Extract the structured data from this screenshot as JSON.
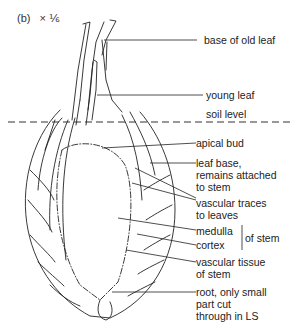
{
  "figure": {
    "panel_label": "(b)",
    "magnification": "× ⅙",
    "labels": {
      "base_of_old_leaf": "base of old leaf",
      "young_leaf": "young leaf",
      "soil_level": "soil level",
      "apical_bud": "apical bud",
      "leaf_base_1": "leaf base,",
      "leaf_base_2": "remains attached",
      "leaf_base_3": "to stem",
      "vascular_traces_1": "vascular traces",
      "vascular_traces_2": "to leaves",
      "medulla": "medulla",
      "cortex": "cortex",
      "of_stem": "of stem",
      "vascular_tissue_1": "vascular tissue",
      "vascular_tissue_2": "of stem",
      "root_1": "root, only small",
      "root_2": "part cut",
      "root_3": "through in LS"
    }
  }
}
